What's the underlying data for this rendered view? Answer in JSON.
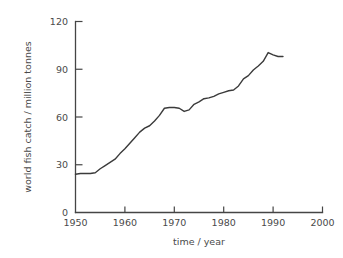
{
  "chart_data": {
    "type": "line",
    "title": "",
    "xlabel": "time / year",
    "ylabel": "world fish catch / million tonnes",
    "xlim": [
      1950,
      2000
    ],
    "ylim": [
      0,
      120
    ],
    "xticks": [
      1950,
      1960,
      1970,
      1980,
      1990,
      2000
    ],
    "yticks": [
      0,
      30,
      60,
      90,
      120
    ],
    "xtick_labels": [
      "1950",
      "1960",
      "1970",
      "1980",
      "1990",
      "2000"
    ],
    "ytick_labels": [
      "0",
      "30",
      "60",
      "90",
      "120"
    ],
    "grid": false,
    "legend": "none",
    "series": [
      {
        "name": "world fish catch",
        "color": "#3b3b3b",
        "x": [
          1950,
          1951,
          1952,
          1953,
          1954,
          1955,
          1956,
          1957,
          1958,
          1959,
          1960,
          1961,
          1962,
          1963,
          1964,
          1965,
          1966,
          1967,
          1968,
          1969,
          1970,
          1971,
          1972,
          1973,
          1974,
          1975,
          1976,
          1977,
          1978,
          1979,
          1980,
          1981,
          1982,
          1983,
          1984,
          1985,
          1986,
          1987,
          1988,
          1989,
          1990,
          1991,
          1992
        ],
        "values": [
          24,
          24.5,
          24.5,
          24.5,
          25,
          27.5,
          29.5,
          31.5,
          33.5,
          37,
          40,
          43.5,
          47,
          50.5,
          53,
          54.5,
          57.5,
          61,
          65.5,
          66,
          66,
          65.5,
          63.5,
          64.5,
          68,
          69.5,
          71.5,
          72,
          73,
          74.5,
          75.5,
          76.5,
          77,
          79.5,
          84,
          86,
          89.5,
          92,
          95,
          100.5,
          99,
          98,
          98
        ]
      }
    ]
  },
  "axes": {
    "x_title": "time / year",
    "y_title": "world fish catch / million tonnes"
  }
}
